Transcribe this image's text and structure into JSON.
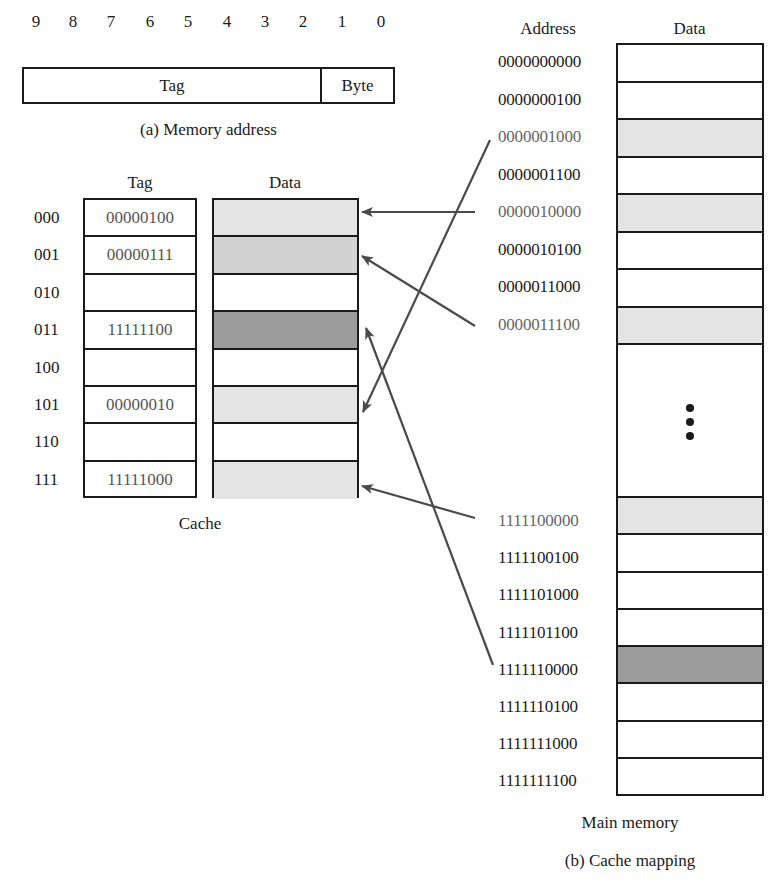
{
  "memory_address": {
    "bit_numbers": [
      "9",
      "8",
      "7",
      "6",
      "5",
      "4",
      "3",
      "2",
      "1",
      "0"
    ],
    "tag_label": "Tag",
    "byte_label": "Byte",
    "caption": "(a) Memory address"
  },
  "cache": {
    "tag_header": "Tag",
    "data_header": "Data",
    "caption": "Cache",
    "rows": [
      {
        "index": "000",
        "tag": "00000100",
        "shade": "light"
      },
      {
        "index": "001",
        "tag": "00000111",
        "shade": "mid"
      },
      {
        "index": "010",
        "tag": "",
        "shade": "none"
      },
      {
        "index": "011",
        "tag": "11111100",
        "shade": "dark"
      },
      {
        "index": "100",
        "tag": "",
        "shade": "none"
      },
      {
        "index": "101",
        "tag": "00000010",
        "shade": "light"
      },
      {
        "index": "110",
        "tag": "",
        "shade": "none"
      },
      {
        "index": "111",
        "tag": "11111000",
        "shade": "light"
      }
    ]
  },
  "main_memory": {
    "address_header": "Address",
    "data_header": "Data",
    "caption": "Main memory",
    "ellipsis": "⋮",
    "top_rows": [
      {
        "address": "0000000000",
        "shade": "none"
      },
      {
        "address": "0000000100",
        "shade": "none"
      },
      {
        "address": "0000001000",
        "shade": "light"
      },
      {
        "address": "0000001100",
        "shade": "none"
      },
      {
        "address": "0000010000",
        "shade": "light"
      },
      {
        "address": "0000010100",
        "shade": "none"
      },
      {
        "address": "0000011000",
        "shade": "none"
      },
      {
        "address": "0000011100",
        "shade": "light"
      }
    ],
    "bottom_rows": [
      {
        "address": "1111100000",
        "shade": "light"
      },
      {
        "address": "1111100100",
        "shade": "none"
      },
      {
        "address": "1111101000",
        "shade": "none"
      },
      {
        "address": "1111101100",
        "shade": "none"
      },
      {
        "address": "1111110000",
        "shade": "dark"
      },
      {
        "address": "1111110100",
        "shade": "none"
      },
      {
        "address": "1111111000",
        "shade": "none"
      },
      {
        "address": "1111111100",
        "shade": "none"
      }
    ]
  },
  "mappings": [
    {
      "from": "0000001000",
      "to_cache_index": "101"
    },
    {
      "from": "0000010000",
      "to_cache_index": "000"
    },
    {
      "from": "0000011100",
      "to_cache_index": "001"
    },
    {
      "from": "1111100000",
      "to_cache_index": "111"
    },
    {
      "from": "1111110000",
      "to_cache_index": "011"
    }
  ],
  "figure_caption": "(b) Cache mapping",
  "colors": {
    "line": "#1a1a1a",
    "arrow": "#4a4a4a",
    "shade_light": "#e4e4e4",
    "shade_mid": "#d2d2d2",
    "shade_dark": "#9c9c9c",
    "highlight_text": "#666666"
  }
}
